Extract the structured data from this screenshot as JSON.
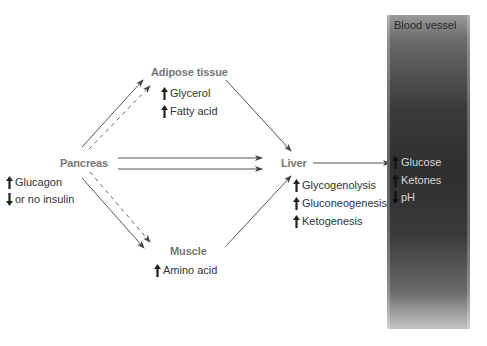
{
  "nodes": {
    "pancreas": {
      "label": "Pancreas",
      "effects": [
        {
          "direction": "up",
          "label": "Glucagon"
        },
        {
          "direction": "down",
          "label": "or no insulin"
        }
      ]
    },
    "adipose": {
      "label": "Adipose tissue",
      "effects": [
        {
          "direction": "up",
          "label": "Glycerol"
        },
        {
          "direction": "up",
          "label": "Fatty acid"
        }
      ]
    },
    "muscle": {
      "label": "Muscle",
      "effects": [
        {
          "direction": "up",
          "label": "Amino acid"
        }
      ]
    },
    "liver": {
      "label": "Liver",
      "effects": [
        {
          "direction": "up",
          "label": "Glycogenolysis"
        },
        {
          "direction": "up",
          "label": "Gluconeogenesis"
        },
        {
          "direction": "up",
          "label": "Ketogenesis"
        }
      ]
    },
    "blood_vessel": {
      "label": "Blood vessel",
      "effects": [
        {
          "direction": "up",
          "label": "Glucose"
        },
        {
          "direction": "up",
          "label": "Ketones"
        },
        {
          "direction": "down",
          "label": "pH"
        }
      ]
    }
  },
  "edges": [
    {
      "from": "Pancreas",
      "to": "Adipose tissue",
      "style": "solid"
    },
    {
      "from": "Pancreas",
      "to": "Adipose tissue",
      "style": "dashed"
    },
    {
      "from": "Pancreas",
      "to": "Liver",
      "style": "solid"
    },
    {
      "from": "Pancreas",
      "to": "Liver",
      "style": "solid"
    },
    {
      "from": "Pancreas",
      "to": "Muscle",
      "style": "solid"
    },
    {
      "from": "Pancreas",
      "to": "Muscle",
      "style": "dashed"
    },
    {
      "from": "Adipose tissue",
      "to": "Liver",
      "style": "solid"
    },
    {
      "from": "Muscle",
      "to": "Liver",
      "style": "solid"
    },
    {
      "from": "Liver",
      "to": "Blood vessel",
      "style": "solid"
    }
  ],
  "colors": {
    "organ_label": "#777777",
    "text": "#333333",
    "arrow": "#555555",
    "vessel_dark": "#2e2e2e",
    "vessel_text": "#d6d6d6"
  }
}
